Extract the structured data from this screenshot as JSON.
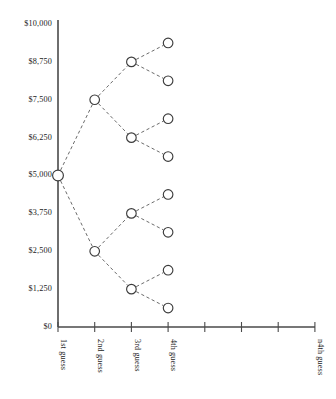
{
  "chart_data": {
    "type": "line",
    "title": "",
    "subtitle": "",
    "xlabel": "",
    "ylabel": "",
    "ylim": [
      0,
      10000
    ],
    "xlim": [
      0,
      8
    ],
    "grid": false,
    "legend": null,
    "y_ticks": [
      {
        "value": 10000,
        "label": "$10,000"
      },
      {
        "value": 8750,
        "label": "$8,750"
      },
      {
        "value": 7500,
        "label": "$7,500"
      },
      {
        "value": 6250,
        "label": "$6,250"
      },
      {
        "value": 5000,
        "label": "$5,000"
      },
      {
        "value": 3750,
        "label": "$3,750"
      },
      {
        "value": 2500,
        "label": "$2,500"
      },
      {
        "value": 1250,
        "label": "$1,250"
      },
      {
        "value": 0,
        "label": "$0"
      }
    ],
    "x_ticks": [
      {
        "index": 0,
        "label": "1st guess"
      },
      {
        "index": 1,
        "label": "2nd guess"
      },
      {
        "index": 2,
        "label": "3rd guess"
      },
      {
        "index": 3,
        "label": "4th guess"
      },
      {
        "index": 4,
        "label": ""
      },
      {
        "index": 5,
        "label": ""
      },
      {
        "index": 6,
        "label": ""
      },
      {
        "index": 7,
        "label": "n4th guess"
      }
    ],
    "nodes": [
      {
        "id": "n0",
        "level": 0,
        "x_index": 0,
        "value": 5000,
        "label": "$5,000"
      },
      {
        "id": "n1u",
        "level": 1,
        "x_index": 1,
        "value": 7500,
        "label": "$7,500"
      },
      {
        "id": "n1d",
        "level": 1,
        "x_index": 1,
        "value": 2500,
        "label": "$2,500"
      },
      {
        "id": "n2uu",
        "level": 2,
        "x_index": 2,
        "value": 8750,
        "label": "$8,750"
      },
      {
        "id": "n2ud",
        "level": 2,
        "x_index": 2,
        "value": 6250,
        "label": "$6,250"
      },
      {
        "id": "n2du",
        "level": 2,
        "x_index": 2,
        "value": 3750,
        "label": "$3,750"
      },
      {
        "id": "n2dd",
        "level": 2,
        "x_index": 2,
        "value": 1250,
        "label": "$1,250"
      },
      {
        "id": "n3uuu",
        "level": 3,
        "x_index": 3,
        "value": 9375,
        "label": "$9,375"
      },
      {
        "id": "n3uud",
        "level": 3,
        "x_index": 3,
        "value": 8125,
        "label": "$8,125"
      },
      {
        "id": "n3udu",
        "level": 3,
        "x_index": 3,
        "value": 6875,
        "label": "$6,875"
      },
      {
        "id": "n3udd",
        "level": 3,
        "x_index": 3,
        "value": 5625,
        "label": "$5,625"
      },
      {
        "id": "n3duu",
        "level": 3,
        "x_index": 3,
        "value": 4375,
        "label": "$4,375"
      },
      {
        "id": "n3dud",
        "level": 3,
        "x_index": 3,
        "value": 3125,
        "label": "$3,125"
      },
      {
        "id": "n3ddu",
        "level": 3,
        "x_index": 3,
        "value": 1875,
        "label": "$1,875"
      },
      {
        "id": "n3ddd",
        "level": 3,
        "x_index": 3,
        "value": 625,
        "label": "$625"
      }
    ],
    "edges": [
      {
        "from": "n0",
        "to": "n1u"
      },
      {
        "from": "n0",
        "to": "n1d"
      },
      {
        "from": "n1u",
        "to": "n2uu"
      },
      {
        "from": "n1u",
        "to": "n2ud"
      },
      {
        "from": "n1d",
        "to": "n2du"
      },
      {
        "from": "n1d",
        "to": "n2dd"
      },
      {
        "from": "n2uu",
        "to": "n3uuu"
      },
      {
        "from": "n2uu",
        "to": "n3uud"
      },
      {
        "from": "n2ud",
        "to": "n3udu"
      },
      {
        "from": "n2ud",
        "to": "n3udd"
      },
      {
        "from": "n2du",
        "to": "n3duu"
      },
      {
        "from": "n2du",
        "to": "n3dud"
      },
      {
        "from": "n2dd",
        "to": "n3ddu"
      },
      {
        "from": "n2dd",
        "to": "n3ddd"
      }
    ],
    "style": {
      "node_fill": "#ffffff",
      "node_stroke": "#3c3c3c",
      "edge_color": "#6b6b6b",
      "axis_color": "#4a4a4a",
      "text_color": "#1a1a1a",
      "background": "#ffffff"
    }
  }
}
